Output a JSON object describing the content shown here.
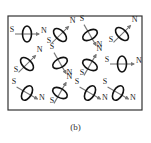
{
  "figure": {
    "caption": "(b)",
    "frame": {
      "x": 8,
      "y": 16,
      "width": 134,
      "height": 94,
      "stroke": "#333333"
    },
    "colors": {
      "ellipse": "#111111",
      "arrow": "#777777",
      "label": "#222222"
    },
    "labels": {
      "south": "S",
      "north": "N"
    },
    "dipoles": [
      {
        "row": 0,
        "col": 0,
        "cx": 27,
        "cy": 34,
        "angle": 0
      },
      {
        "row": 0,
        "col": 1,
        "cx": 60,
        "cy": 35,
        "angle": -45
      },
      {
        "row": 0,
        "col": 2,
        "cx": 90,
        "cy": 35,
        "angle": 60
      },
      {
        "row": 0,
        "col": 3,
        "cx": 122,
        "cy": 34,
        "angle": -45
      },
      {
        "row": 1,
        "col": 0,
        "cx": 27,
        "cy": 64,
        "angle": -45
      },
      {
        "row": 1,
        "col": 1,
        "cx": 60,
        "cy": 63,
        "angle": 60
      },
      {
        "row": 1,
        "col": 2,
        "cx": 90,
        "cy": 65,
        "angle": -60
      },
      {
        "row": 1,
        "col": 3,
        "cx": 122,
        "cy": 64,
        "angle": 0
      },
      {
        "row": 2,
        "col": 0,
        "cx": 27,
        "cy": 93,
        "angle": 30
      },
      {
        "row": 2,
        "col": 1,
        "cx": 60,
        "cy": 93,
        "angle": -60
      },
      {
        "row": 2,
        "col": 2,
        "cx": 90,
        "cy": 93,
        "angle": 30
      },
      {
        "row": 2,
        "col": 3,
        "cx": 118,
        "cy": 93,
        "angle": 30
      }
    ]
  }
}
